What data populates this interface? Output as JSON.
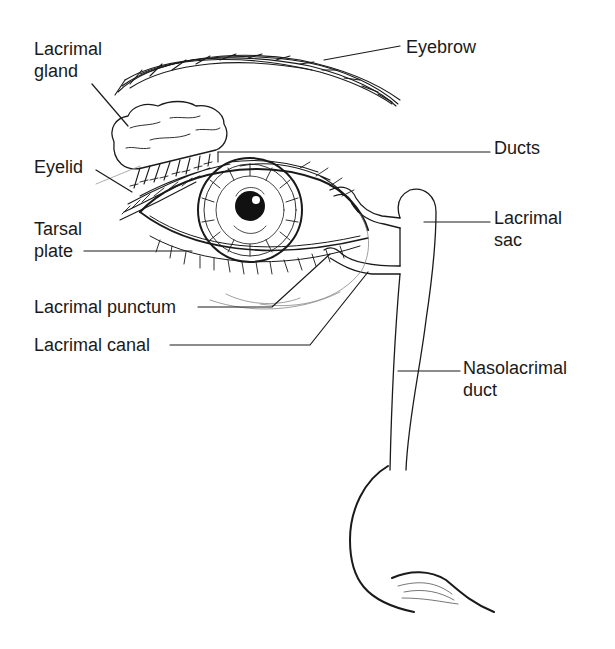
{
  "diagram": {
    "colors": {
      "ink": "#1a1a1a",
      "light_ink": "#777777",
      "background": "#ffffff"
    },
    "labels": [
      {
        "id": "lacrimal-gland",
        "line1": "Lacrimal",
        "line2": "gland",
        "x": 34,
        "y": 38
      },
      {
        "id": "eyebrow",
        "line1": "Eyebrow",
        "line2": "",
        "x": 406,
        "y": 38
      },
      {
        "id": "ducts",
        "line1": "Ducts",
        "line2": "",
        "x": 494,
        "y": 136
      },
      {
        "id": "eyelid",
        "line1": "Eyelid",
        "line2": "",
        "x": 34,
        "y": 156
      },
      {
        "id": "lacrimal-sac",
        "line1": "Lacrimal",
        "line2": "sac",
        "x": 494,
        "y": 206
      },
      {
        "id": "tarsal-plate",
        "line1": "Tarsal",
        "line2": "plate",
        "x": 34,
        "y": 216
      },
      {
        "id": "lacrimal-punctum",
        "line1": "Lacrimal punctum",
        "line2": "",
        "x": 34,
        "y": 297
      },
      {
        "id": "lacrimal-canal",
        "line1": "Lacrimal canal",
        "line2": "",
        "x": 34,
        "y": 335
      },
      {
        "id": "nasolacrimal-duct",
        "line1": "Nasolacrimal",
        "line2": "duct",
        "x": 463,
        "y": 356
      }
    ]
  }
}
